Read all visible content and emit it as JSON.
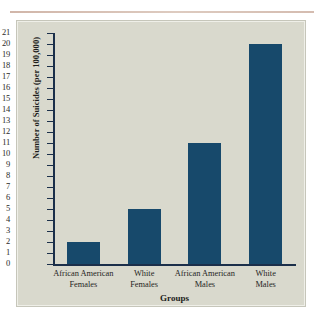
{
  "figure": {
    "background_color": "#d9d9cd",
    "bar_color": "#17496b",
    "axis_color": "#1b2f4a"
  },
  "chart_data": {
    "type": "bar",
    "title": "",
    "xlabel": "Groups",
    "ylabel": "Number of Suicides (per 100,000)",
    "categories": [
      "African American Females",
      "White Females",
      "African American Males",
      "White Males"
    ],
    "category_lines": [
      [
        "African American",
        "Females"
      ],
      [
        "White",
        "Females"
      ],
      [
        "African American",
        "Males"
      ],
      [
        "White",
        "Males"
      ]
    ],
    "values": [
      2,
      5,
      11,
      20
    ],
    "ylim": [
      0,
      21
    ],
    "ytick_step": 1,
    "yticks": [
      "21",
      "20",
      "19",
      "18",
      "17",
      "16",
      "15",
      "14",
      "13",
      "12",
      "11",
      "10",
      "9",
      "8",
      "7",
      "6",
      "5",
      "4",
      "3",
      "2",
      "1",
      "0"
    ],
    "grid": false,
    "legend": false
  }
}
